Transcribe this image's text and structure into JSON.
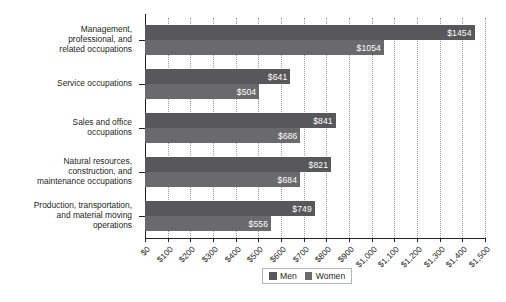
{
  "chart_data": {
    "type": "bar",
    "orientation": "horizontal",
    "title": "",
    "xlabel": "",
    "ylabel": "",
    "xlim": [
      0,
      1500
    ],
    "xticks": [
      0,
      100,
      200,
      300,
      400,
      500,
      600,
      700,
      800,
      900,
      1000,
      1100,
      1200,
      1300,
      1400,
      1500
    ],
    "xticklabels": [
      "$0",
      "$100",
      "$200",
      "$300",
      "$400",
      "$500",
      "$600",
      "$700",
      "$800",
      "$900",
      "$1,000",
      "$1,100",
      "$1,200",
      "$1,300",
      "$1,400",
      "$1,500"
    ],
    "grid": "vertical-dotted",
    "legend_position": "bottom-center",
    "categories": [
      "Management, professional, and related occupations",
      "Service occupations",
      "Sales and office occupations",
      "Natural resources, construction, and maintenance occupations",
      "Production, transportation, and material moving operations"
    ],
    "category_lines": [
      [
        "Management,",
        "professional, and",
        "related occupations"
      ],
      [
        "Service occupations"
      ],
      [
        "Sales and office",
        "occupations"
      ],
      [
        "Natural resources,",
        "construction, and",
        "maintenance occupations"
      ],
      [
        "Production, transportation,",
        "and material moving",
        "operations"
      ]
    ],
    "series": [
      {
        "name": "Men",
        "color": "#58585a",
        "values": [
          1454,
          641,
          841,
          821,
          749
        ],
        "labels": [
          "$1454",
          "$641",
          "$841",
          "$821",
          "$749"
        ]
      },
      {
        "name": "Women",
        "color": "#6a6a6c",
        "values": [
          1054,
          504,
          686,
          684,
          556
        ],
        "labels": [
          "$1054",
          "$504",
          "$686",
          "$684",
          "$556"
        ]
      }
    ]
  },
  "legend": {
    "items": [
      {
        "label": "Men",
        "color": "#58585a"
      },
      {
        "label": "Women",
        "color": "#6a6a6c"
      }
    ]
  }
}
